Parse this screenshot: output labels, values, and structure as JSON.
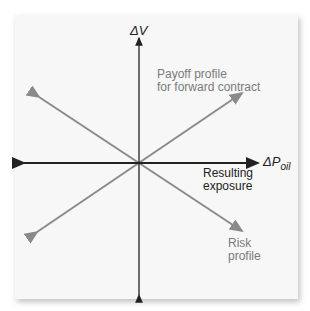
{
  "diagram": {
    "axes": {
      "y_label": "ΔV",
      "x_label_main": "ΔP",
      "x_label_sub": "oil"
    },
    "labels": {
      "forward_line1": "Payoff profile",
      "forward_line2": "for forward contract",
      "resulting_line1": "Resulting",
      "resulting_line2": "exposure",
      "risk_line1": "Risk",
      "risk_line2": "profile"
    },
    "colors": {
      "axis": "#222222",
      "profile": "#8a8a8a",
      "background": "#f7f7f7"
    }
  }
}
